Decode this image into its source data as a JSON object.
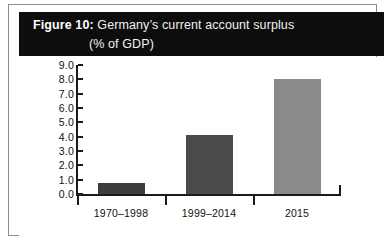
{
  "figure": {
    "title_label": "Figure 10:",
    "title_line1": " Germany’s current account surplus",
    "title_line2": "(% of GDP)",
    "band_color": "#0d0d0d",
    "band_text_color": "#ffffff"
  },
  "chart_data": {
    "type": "bar",
    "title": "Figure 10: Germany’s current account surplus (% of GDP)",
    "xlabel": "",
    "ylabel": "",
    "categories": [
      "1970–1998",
      "1999–2014",
      "2015"
    ],
    "values": [
      0.75,
      4.1,
      8.0
    ],
    "bar_colors": [
      "#3d3d3d",
      "#4a4a4a",
      "#8a8a8a"
    ],
    "ylim": [
      0.0,
      9.0
    ],
    "ytick_step": 1.0,
    "ytick_labels": [
      "0.0",
      "1.0",
      "2.0",
      "3.0",
      "4.0",
      "5.0",
      "6.0",
      "7.0",
      "8.0",
      "9.0"
    ],
    "grid": false,
    "legend": false,
    "axis_color": "#1a1a1a"
  }
}
